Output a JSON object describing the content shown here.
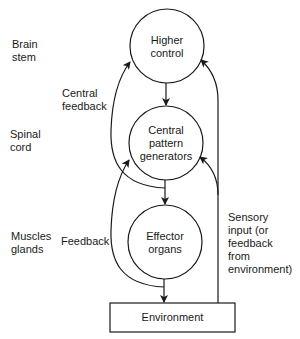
{
  "levels": {
    "brain_stem": "Brain\nstem",
    "spinal_cord": "Spinal\ncord",
    "muscles_glands": "Muscles\nglands"
  },
  "nodes": {
    "higher_control": "Higher\ncontrol",
    "cpg": "Central\npattern\ngenerators",
    "effector": "Effector\norgans",
    "environment": "Environment"
  },
  "edges": {
    "central_feedback": "Central\nfeedback",
    "feedback": "Feedback",
    "sensory_input": "Sensory\ninput (or\nfeedback\nfrom\nenvironment)"
  },
  "colors": {
    "stroke": "#1a1a1a",
    "background": "#ffffff"
  }
}
